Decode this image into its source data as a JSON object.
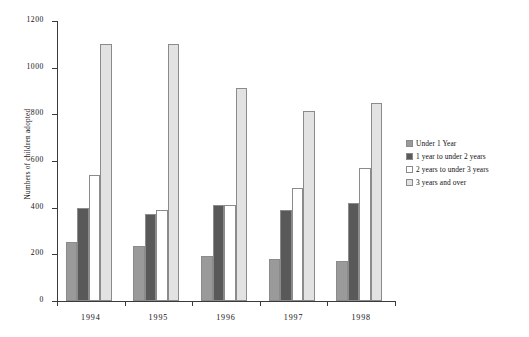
{
  "chart_data": {
    "type": "bar",
    "title": "",
    "subtitle": "",
    "xlabel": "",
    "ylabel": "Numbers of children adopted",
    "categories": [
      "1994",
      "1995",
      "1996",
      "1997",
      "1998"
    ],
    "series": [
      {
        "name": "Under 1 Year",
        "color": "#9a9a9a",
        "values": [
          255,
          235,
          195,
          182,
          172
        ]
      },
      {
        "name": "1 year to under 2 years",
        "color": "#595959",
        "values": [
          400,
          372,
          410,
          390,
          420
        ]
      },
      {
        "name": "2 years to under 3 years",
        "color": "#ffffff",
        "values": [
          540,
          390,
          412,
          485,
          570
        ]
      },
      {
        "name": "3 years and over",
        "color": "#e2e2e2",
        "values": [
          1100,
          1100,
          915,
          815,
          848
        ]
      }
    ],
    "ylim": [
      0,
      1200
    ],
    "yticks": [
      0,
      200,
      400,
      600,
      800,
      1000,
      1200
    ],
    "ytick_labels": [
      "0",
      "200",
      "400",
      "600",
      "800",
      "1000",
      "1200"
    ],
    "grid": false,
    "legend_position": "right",
    "legend": [
      "Under 1 Year",
      "1 year to under 2 years",
      "2 years to under 3 years",
      "3 years and over"
    ],
    "axis_color": "#3a3a3a",
    "bar_border_color": "#8b8b8b",
    "background": "#ffffff"
  }
}
